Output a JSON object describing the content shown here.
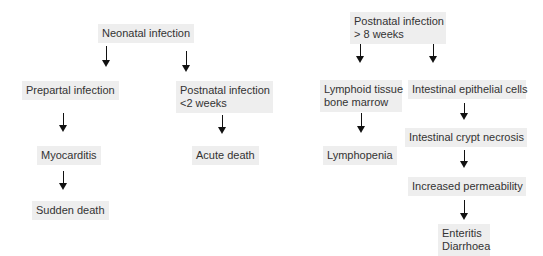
{
  "diagram": {
    "nodes": [
      {
        "id": "neonatal",
        "lines": [
          "Neonatal infection"
        ]
      },
      {
        "id": "prepartal",
        "lines": [
          "Prepartal infection"
        ]
      },
      {
        "id": "postnatal_lt2",
        "lines": [
          "Postnatal infection",
          "<2 weeks"
        ]
      },
      {
        "id": "myocarditis",
        "lines": [
          "Myocarditis"
        ]
      },
      {
        "id": "acute_death",
        "lines": [
          "Acute death"
        ]
      },
      {
        "id": "sudden_death",
        "lines": [
          "Sudden death"
        ]
      },
      {
        "id": "postnatal_gt8",
        "lines": [
          "Postnatal infection",
          "> 8 weeks"
        ]
      },
      {
        "id": "lymphoid",
        "lines": [
          "Lymphoid tissue",
          "bone marrow"
        ]
      },
      {
        "id": "intestinal_epithelial",
        "lines": [
          "Intestinal epithelial cells"
        ]
      },
      {
        "id": "lymphopenia",
        "lines": [
          "Lymphopenia"
        ]
      },
      {
        "id": "crypt_necrosis",
        "lines": [
          "Intestinal crypt necrosis"
        ]
      },
      {
        "id": "permeability",
        "lines": [
          "Increased permeability"
        ]
      },
      {
        "id": "enteritis",
        "lines": [
          "Enteritis",
          "Diarrhoea"
        ]
      }
    ],
    "edges": [
      [
        "neonatal",
        "prepartal"
      ],
      [
        "neonatal",
        "postnatal_lt2"
      ],
      [
        "prepartal",
        "myocarditis"
      ],
      [
        "myocarditis",
        "sudden_death"
      ],
      [
        "postnatal_lt2",
        "acute_death"
      ],
      [
        "postnatal_gt8",
        "lymphoid"
      ],
      [
        "postnatal_gt8",
        "intestinal_epithelial"
      ],
      [
        "lymphoid",
        "lymphopenia"
      ],
      [
        "intestinal_epithelial",
        "crypt_necrosis"
      ],
      [
        "crypt_necrosis",
        "permeability"
      ],
      [
        "permeability",
        "enteritis"
      ]
    ],
    "colors": {
      "box_bg": "#eeeeee",
      "text": "#333333",
      "arrow": "#111111"
    }
  }
}
